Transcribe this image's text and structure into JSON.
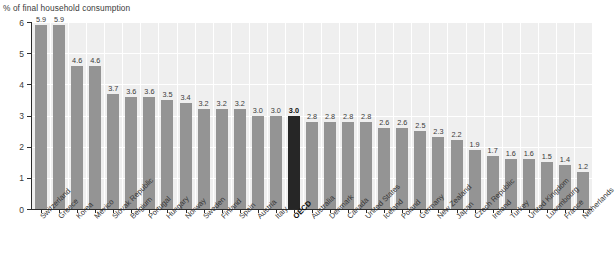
{
  "chart_data": {
    "type": "bar",
    "title": "% of final household consumption",
    "xlabel": "",
    "ylabel": "",
    "ylim": [
      0,
      6
    ],
    "yticks": [
      "0",
      "1",
      "2",
      "3",
      "4",
      "5",
      "6"
    ],
    "grid": true,
    "legend": "none",
    "highlight_category": "OECD",
    "colors": {
      "bar": "#949494",
      "bar_highlight": "#262626",
      "plot_background": "#efefef",
      "gridline": "#ffffff",
      "axis": "#2b2b2b",
      "text": "#3a3a3a"
    },
    "categories": [
      "Switzerland",
      "Greece",
      "Korea",
      "Mexico",
      "Slovak Republic",
      "Belgium",
      "Portugal",
      "Hungary",
      "Norway",
      "Sweden",
      "Finland",
      "Spain",
      "Austria",
      "Italy",
      "OECD",
      "Australia",
      "Denmark",
      "Canada",
      "United States",
      "Iceland",
      "Poland",
      "Germany",
      "New Zealand",
      "Japan",
      "Czech Republic",
      "Ireland",
      "Turkey",
      "United Kingdom",
      "Luxembourg",
      "France",
      "Netherlands"
    ],
    "values": [
      5.9,
      5.9,
      4.6,
      4.6,
      3.7,
      3.6,
      3.6,
      3.5,
      3.4,
      3.2,
      3.2,
      3.2,
      3.0,
      3.0,
      3.0,
      2.8,
      2.8,
      2.8,
      2.8,
      2.6,
      2.6,
      2.5,
      2.3,
      2.2,
      1.9,
      1.7,
      1.6,
      1.6,
      1.5,
      1.4,
      1.2
    ],
    "value_labels": [
      "5.9",
      "5.9",
      "4.6",
      "4.6",
      "3.7",
      "3.6",
      "3.6",
      "3.5",
      "3.4",
      "3.2",
      "3.2",
      "3.2",
      "3.0",
      "3.0",
      "3.0",
      "2.8",
      "2.8",
      "2.8",
      "2.8",
      "2.6",
      "2.6",
      "2.5",
      "2.3",
      "2.2",
      "1.9",
      "1.7",
      "1.6",
      "1.6",
      "1.5",
      "1.4",
      "1.2"
    ]
  }
}
